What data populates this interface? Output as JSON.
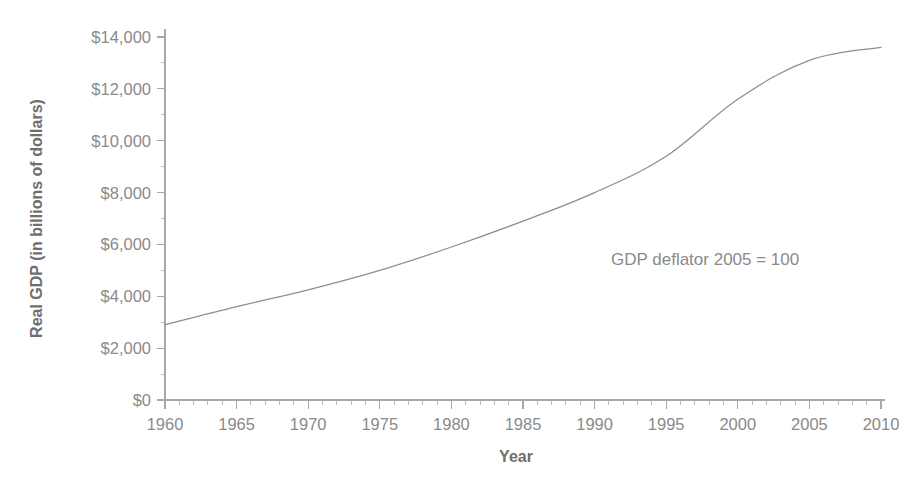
{
  "chart_data": {
    "type": "line",
    "title": "",
    "xlabel": "Year",
    "ylabel": "Real GDP (in billions of dollars)",
    "xlim": [
      1960,
      2010
    ],
    "ylim": [
      0,
      14000
    ],
    "grid": false,
    "legend": null,
    "annotations": [
      {
        "text": "GDP deflator 2005 = 100",
        "x": 1993,
        "y": 6100
      }
    ],
    "x_ticks": [
      1960,
      1965,
      1970,
      1975,
      1980,
      1985,
      1990,
      1995,
      2000,
      2005,
      2010
    ],
    "x_tick_labels": [
      "1960",
      "1965",
      "1970",
      "1975",
      "1980",
      "1985",
      "1990",
      "1995",
      "2000",
      "2005",
      "2010"
    ],
    "x_minor_tick_step": 1,
    "y_ticks": [
      0,
      2000,
      4000,
      6000,
      8000,
      10000,
      12000,
      14000
    ],
    "y_tick_labels": [
      "$0",
      "$2,000",
      "$4,000",
      "$6,000",
      "$8,000",
      "$10,000",
      "$12,000",
      "$14,000"
    ],
    "y_minor_tick_step": 1000,
    "series": [
      {
        "name": "Real GDP",
        "color": "#8e8e8e",
        "x": [
          1960,
          1965,
          1970,
          1975,
          1980,
          1985,
          1990,
          1995,
          2000,
          2005,
          2010
        ],
        "values": [
          2900,
          3600,
          4250,
          5000,
          5900,
          6900,
          8000,
          9400,
          11600,
          13100,
          13600
        ]
      }
    ]
  },
  "colors": {
    "background": "#ffffff",
    "axis": "#a8a8a8",
    "line": "#8e8e8e",
    "tick_text": "#8a8a8a",
    "title_text": "#6f6f6f"
  }
}
